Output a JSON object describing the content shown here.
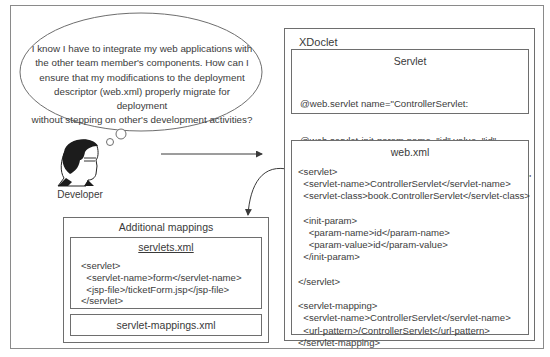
{
  "thought_bubble": {
    "lines": [
      "I know I have to integrate my web applications with",
      "the other team member's components. How can I",
      "ensure that my modifications to the deployment",
      "descriptor (web.xml) properly migrate for deployment",
      "without stepping on other's development activities?"
    ]
  },
  "developer": {
    "icon": "developer-portrait-icon",
    "label": "Developer"
  },
  "xdoclet": {
    "title": "XDoclet",
    "servlet_box": {
      "title": "Servlet",
      "lines": [
        "@web.servlet name=\"ControllerServlet:",
        "@web.servlet-init-param name=\"id\" value=\"id\"",
        "@web.servlet-mapping url-pattern=\"/ControllerServlet\""
      ]
    },
    "webxml_box": {
      "title": "web.xml",
      "code": "<servlet>\n  <servlet-name>ControllerServlet</servlet-name>\n  <servlet-class>book.ControllerServlet</servlet-class>\n\n  <init-param>\n    <param-name>id</param-name>\n    <param-value>id</param-value>\n  </init-param>\n\n</servlet>\n\n<servlet-mapping>\n  <servlet-name>ControllerServlet</servlet-name>\n  <url-pattern>/ControllerServlet</url-pattern>\n</servlet-mapping>"
    }
  },
  "additional_mappings": {
    "title": "Additional mappings",
    "servlets_xml": {
      "title": "servlets.xml",
      "code": "<servlet>\n  <servlet-name>form</servlet-name>\n  <jsp-file>/ticketForm.jsp</jsp-file>\n</servlet>"
    },
    "servlet_mappings_xml": {
      "title": "servlet-mappings.xml"
    }
  },
  "colors": {
    "frame": "#8a8a8a",
    "box_border": "#6e6e6e",
    "text": "#3a3a3a",
    "arrow": "#3a3a3a"
  }
}
